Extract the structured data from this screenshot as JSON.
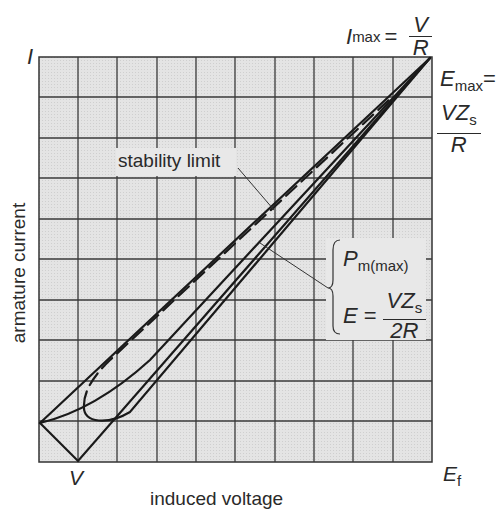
{
  "figure": {
    "type": "diagram",
    "background_color": "#e6e6e6",
    "line_color": "#1a1a1a"
  },
  "axes": {
    "y_axis_label": "armature current",
    "y_axis_symbol": "I",
    "x_axis_label": "induced voltage",
    "x_axis_symbol": "E",
    "x_axis_symbol_sub": "f",
    "x_tick_label": "V",
    "grid": {
      "rows": 10,
      "cols": 10
    }
  },
  "annotations": {
    "imax": {
      "lhs": "I",
      "lhs_sub": "max",
      "eq": "=",
      "num": "V",
      "den": "R"
    },
    "emax": {
      "lhs": "E",
      "lhs_sub": "max",
      "eq": "=",
      "num": "VZ",
      "num_sub": "s",
      "den": "R"
    },
    "stability_limit": "stability limit",
    "pmmax": {
      "p": "P",
      "p_sub": "m(max)",
      "e": "E",
      "eq": "=",
      "num": "VZ",
      "num_sub": "s",
      "den": "2R"
    }
  }
}
